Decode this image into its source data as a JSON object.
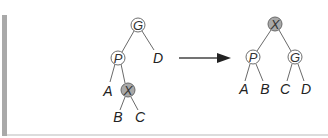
{
  "diagram": {
    "title": "",
    "colors": {
      "node_fill": "#ffffff",
      "shaded_node_fill": "#a8a8a8",
      "edge": "#6a6a6a",
      "side_bar": "#a9a9a9"
    },
    "before": {
      "nodes": [
        {
          "id": "G",
          "label": "G",
          "shaded": false
        },
        {
          "id": "P",
          "label": "P",
          "shaded": false
        },
        {
          "id": "X",
          "label": "X",
          "shaded": true
        }
      ],
      "leaves": [
        {
          "label": "D"
        },
        {
          "label": "A"
        },
        {
          "label": "B"
        },
        {
          "label": "C"
        }
      ],
      "edges": [
        [
          "G",
          "P"
        ],
        [
          "G",
          "D"
        ],
        [
          "P",
          "A"
        ],
        [
          "P",
          "X"
        ],
        [
          "X",
          "B"
        ],
        [
          "X",
          "C"
        ]
      ]
    },
    "arrow": {
      "direction": "right"
    },
    "after": {
      "nodes": [
        {
          "id": "X",
          "label": "X",
          "shaded": true
        },
        {
          "id": "P",
          "label": "P",
          "shaded": false
        },
        {
          "id": "G",
          "label": "G",
          "shaded": false
        }
      ],
      "leaves": [
        {
          "label": "A"
        },
        {
          "label": "B"
        },
        {
          "label": "C"
        },
        {
          "label": "D"
        }
      ],
      "edges": [
        [
          "X",
          "P"
        ],
        [
          "X",
          "G"
        ],
        [
          "P",
          "A"
        ],
        [
          "P",
          "B"
        ],
        [
          "G",
          "C"
        ],
        [
          "G",
          "D"
        ]
      ]
    }
  }
}
